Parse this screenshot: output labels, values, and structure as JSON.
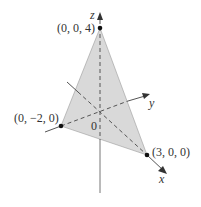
{
  "diagram": {
    "type": "3d-plane-intercepts",
    "axes": {
      "x_label": "x",
      "y_label": "y",
      "z_label": "z",
      "origin_label": "0"
    },
    "points": [
      {
        "label": "(0, 0, 4)",
        "coords": [
          0,
          0,
          4
        ]
      },
      {
        "label": "(0, −2, 0)",
        "coords": [
          0,
          -2,
          0
        ]
      },
      {
        "label": "(3, 0, 0)",
        "coords": [
          3,
          0,
          0
        ]
      }
    ],
    "plane_fill_color": "#d9d9d9",
    "line_color": "#555555",
    "point_color": "#111111"
  }
}
